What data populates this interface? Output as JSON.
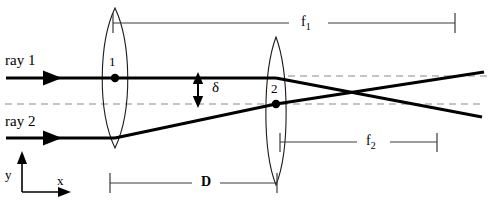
{
  "figure": {
    "type": "optics-ray-diagram",
    "colors": {
      "ink": "#000000",
      "thin_line": "#3a3a3a",
      "dashed": "#8a8a8a",
      "background": "#ffffff"
    },
    "labels": {
      "ray1": "ray 1",
      "ray2": "ray 2",
      "lens1_number": "1",
      "lens2_number": "2",
      "separation_delta": "δ",
      "focal_length_1": "f",
      "focal_length_1_sub": "1",
      "focal_length_2": "f",
      "focal_length_2_sub": "2",
      "lens_separation": "D",
      "axis_y": "y",
      "axis_x": "x"
    },
    "elements": [
      {
        "name": "lens-1",
        "kind": "biconvex-lens",
        "center_x": 115,
        "center_y": 78,
        "half_height": 70,
        "half_width": 18
      },
      {
        "name": "lens-2",
        "kind": "biconvex-lens",
        "center_x": 276,
        "center_y": 111,
        "half_height": 74,
        "half_width": 14
      },
      {
        "name": "ray-1",
        "kind": "ray",
        "entry_y": 78
      },
      {
        "name": "ray-2",
        "kind": "ray",
        "entry_y": 138
      },
      {
        "name": "optical-axis-1",
        "kind": "dashed-reference",
        "y": 104
      },
      {
        "name": "optical-axis-2",
        "kind": "dashed-reference",
        "y": 76
      },
      {
        "name": "ray-crossing-point",
        "kind": "intersection",
        "x": 365,
        "y": 95
      }
    ],
    "dimensions": [
      {
        "name": "f1",
        "from_x": 113,
        "to_x": 455,
        "y": 23
      },
      {
        "name": "f2",
        "from_x": 280,
        "to_x": 437,
        "y": 142
      },
      {
        "name": "D",
        "from_x": 110,
        "to_x": 277,
        "y": 183
      }
    ]
  }
}
